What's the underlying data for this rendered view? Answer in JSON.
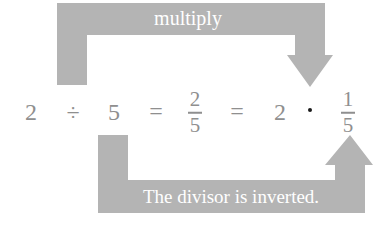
{
  "diagram": {
    "top_arrow": {
      "label": "multiply",
      "color": "#b4b4b4"
    },
    "bottom_arrow": {
      "label": "The divisor is inverted.",
      "color": "#b4b4b4"
    },
    "equation": {
      "dividend": "2",
      "divide_symbol": "÷",
      "divisor": "5",
      "equals_1": "=",
      "fraction": {
        "numerator": "2",
        "denominator": "5"
      },
      "equals_2": "=",
      "factor": "2",
      "multiply_symbol": "·",
      "reciprocal": {
        "numerator": "1",
        "denominator": "5"
      }
    },
    "text_color": "#8f8f8f"
  }
}
